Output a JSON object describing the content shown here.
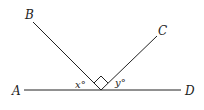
{
  "diagram": {
    "points": {
      "A": {
        "label": "A"
      },
      "B": {
        "label": "B"
      },
      "C": {
        "label": "C"
      },
      "D": {
        "label": "D"
      }
    },
    "angles": {
      "x": {
        "label": "x°"
      },
      "y": {
        "label": "y°"
      }
    },
    "right_angle_marker": true,
    "line_color": "#222222"
  }
}
